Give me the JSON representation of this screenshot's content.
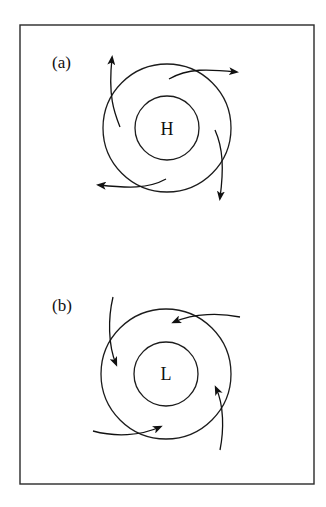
{
  "figure": {
    "frame_color": "#2a2a2a",
    "line_color": "#111111",
    "background": "#ffffff"
  },
  "panels": [
    {
      "id": "a",
      "label": "(a)",
      "center_label": "H",
      "meaning": "high pressure",
      "circulation": "clockwise, outward (divergent)",
      "center": [
        167,
        128
      ],
      "inner_radius": 32,
      "outer_radius": 64,
      "arrows": [
        {
          "direction": "up",
          "path": "M120,127 C114,112 108,96 112,58"
        },
        {
          "direction": "right",
          "path": "M169,79 C188,68 208,69 236,72"
        },
        {
          "direction": "down",
          "path": "M215,130 C223,148 224,168 220,198"
        },
        {
          "direction": "left",
          "path": "M166,179 C148,189 128,188 99,185"
        }
      ]
    },
    {
      "id": "b",
      "label": "(b)",
      "center_label": "L",
      "meaning": "low pressure",
      "circulation": "counter-clockwise, inward (convergent)",
      "center": [
        166,
        374
      ],
      "inner_radius": 32,
      "outer_radius": 65,
      "arrows": [
        {
          "direction": "down-inward",
          "path": "M113,297 C108,318 108,345 116,364"
        },
        {
          "direction": "left-inward",
          "path": "M240,317 C220,313 195,313 174,322"
        },
        {
          "direction": "up-inward",
          "path": "M220,450 C224,430 224,405 216,388"
        },
        {
          "direction": "right-inward",
          "path": "M93,431 C115,437 140,436 160,427"
        }
      ]
    }
  ]
}
